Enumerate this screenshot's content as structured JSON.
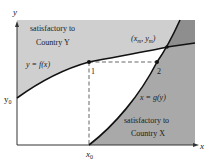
{
  "figure": {
    "type": "diagram",
    "axes": {
      "x_label": "x",
      "y_label": "y",
      "x_tick_label": "x",
      "x_tick_sub": "0",
      "y_tick_label": "y",
      "y_tick_sub": "0"
    },
    "curves": {
      "f": {
        "label": "y = f(x)"
      },
      "g": {
        "label": "x = g(y)"
      }
    },
    "points": {
      "p1": {
        "label": "1"
      },
      "p2": {
        "label": "2"
      },
      "equilibrium": {
        "label_open": "(x",
        "sub_m1": "m",
        "label_mid": ", y",
        "sub_m2": "m",
        "label_close": ")"
      }
    },
    "regions": {
      "country_y": {
        "line1": "satisfactory to",
        "line2": "Country Y"
      },
      "country_x": {
        "line1": "satisfactory to",
        "line2": "Country X"
      }
    },
    "colors": {
      "region_y": "#cfcfcf",
      "region_x": "#a9a9a9",
      "region_overlap": "#8e8e8e",
      "region_neutral": "#ffffff",
      "curve": "#111111",
      "axis": "#333333"
    }
  }
}
